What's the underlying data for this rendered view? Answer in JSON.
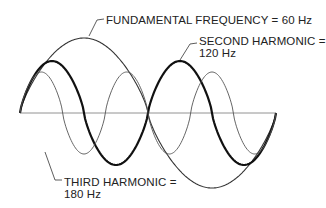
{
  "labels": {
    "fundamental": "FUNDAMENTAL FREQUENCY = 60 Hz",
    "second_line1": "SECOND HARMONIC =",
    "second_line2": "120 Hz",
    "third_line1": "THIRD HARMONIC =",
    "third_line2": "180 Hz"
  },
  "waves": [
    {
      "name": "fundamental",
      "frequency_hz": 60,
      "cycles": 1,
      "amplitude": 75,
      "stroke": "#333333",
      "width": 1.1
    },
    {
      "name": "second-harmonic",
      "frequency_hz": 120,
      "cycles": 2,
      "amplitude": 52,
      "stroke": "#111111",
      "width": 2.2
    },
    {
      "name": "third-harmonic",
      "frequency_hz": 180,
      "cycles": 3,
      "amplitude": 41,
      "stroke": "#555555",
      "width": 0.9
    }
  ],
  "axis": {
    "x0": 20,
    "x1": 276,
    "y": 113,
    "color": "#777777"
  }
}
